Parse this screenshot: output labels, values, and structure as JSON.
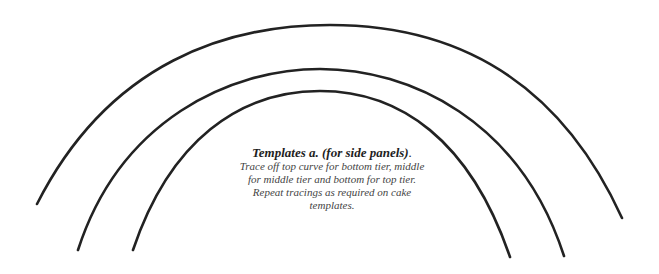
{
  "diagram": {
    "title": "Templates a. (for side panels).",
    "heading_main": "Templates a. (for side panels)",
    "heading_period": ".",
    "description_lines": [
      "Trace off top curve for bottom tier, middle",
      "for middle tier and bottom for top tier.",
      "Repeat tracings as required on cake",
      "templates."
    ],
    "curves": [
      {
        "name": "top-curve",
        "tier": "bottom tier",
        "start": [
          37,
          204
        ],
        "apex": [
          330,
          25
        ],
        "end": [
          622,
          218
        ]
      },
      {
        "name": "middle-curve",
        "tier": "middle tier",
        "start": [
          78,
          250
        ],
        "apex": [
          320,
          69
        ],
        "end": [
          564,
          256
        ]
      },
      {
        "name": "bottom-curve",
        "tier": "top tier",
        "start": [
          133,
          250
        ],
        "apex": [
          320,
          91
        ],
        "end": [
          510,
          257
        ]
      }
    ],
    "stroke_color": "#222222",
    "text_color": "#3a3a3a"
  }
}
